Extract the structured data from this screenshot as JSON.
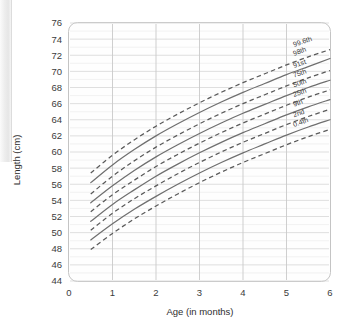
{
  "chart_data": {
    "type": "line",
    "title": "",
    "xlabel": "Age (in months)",
    "ylabel": "Length (cm)",
    "xlim": [
      0,
      6
    ],
    "ylim": [
      44,
      76
    ],
    "xticks": [
      "0",
      "1",
      "2",
      "3",
      "4",
      "5",
      "6"
    ],
    "yticks": [
      "44",
      "46",
      "48",
      "50",
      "52",
      "54",
      "56",
      "58",
      "60",
      "62",
      "64",
      "66",
      "68",
      "70",
      "72",
      "74",
      "76"
    ],
    "grid": true,
    "legend_position": "inline-right-end-labels",
    "x": [
      0.5,
      1,
      1.5,
      2,
      2.5,
      3,
      3.5,
      4,
      4.5,
      5,
      5.5,
      6
    ],
    "series": [
      {
        "name": "99.6th",
        "label": "99.6th",
        "style": "dashed",
        "values": [
          57.4,
          59.6,
          61.5,
          63.2,
          64.7,
          66.1,
          67.4,
          68.6,
          69.7,
          70.8,
          71.8,
          72.7
        ]
      },
      {
        "name": "98th",
        "label": "98th",
        "style": "solid",
        "values": [
          56.2,
          58.4,
          60.3,
          62.0,
          63.5,
          64.9,
          66.2,
          67.4,
          68.5,
          69.6,
          70.6,
          71.6
        ]
      },
      {
        "name": "91st",
        "label": "91st",
        "style": "dashed",
        "values": [
          54.8,
          57.0,
          58.9,
          60.6,
          62.1,
          63.5,
          64.8,
          66.0,
          67.1,
          68.2,
          69.2,
          70.1
        ]
      },
      {
        "name": "75th",
        "label": "75th",
        "style": "solid",
        "values": [
          53.7,
          55.8,
          57.7,
          59.4,
          60.9,
          62.3,
          63.6,
          64.8,
          65.9,
          67.0,
          68.0,
          68.9
        ]
      },
      {
        "name": "50th",
        "label": "50th",
        "style": "dashed",
        "values": [
          52.6,
          54.7,
          56.5,
          58.2,
          59.7,
          61.1,
          62.4,
          63.6,
          64.7,
          65.8,
          66.8,
          67.7
        ]
      },
      {
        "name": "25th",
        "label": "25th",
        "style": "solid",
        "values": [
          51.4,
          53.5,
          55.3,
          57.0,
          58.5,
          59.9,
          61.2,
          62.4,
          63.5,
          64.6,
          65.6,
          66.5
        ]
      },
      {
        "name": "9th",
        "label": "9th",
        "style": "dashed",
        "values": [
          50.3,
          52.4,
          54.2,
          55.8,
          57.3,
          58.7,
          60.0,
          61.2,
          62.3,
          63.4,
          64.4,
          65.3
        ]
      },
      {
        "name": "2nd",
        "label": "2nd",
        "style": "solid",
        "values": [
          49.1,
          51.1,
          52.9,
          54.5,
          56.0,
          57.4,
          58.7,
          59.9,
          61.0,
          62.1,
          63.1,
          64.0
        ]
      },
      {
        "name": "0.4th",
        "label": "0.4th",
        "style": "dashed",
        "values": [
          47.9,
          49.9,
          51.7,
          53.3,
          54.8,
          56.2,
          57.5,
          58.7,
          59.8,
          60.9,
          61.9,
          62.8
        ]
      }
    ]
  },
  "axes": {
    "y_title": "Length (cm)",
    "x_title": "Age (in months)"
  }
}
